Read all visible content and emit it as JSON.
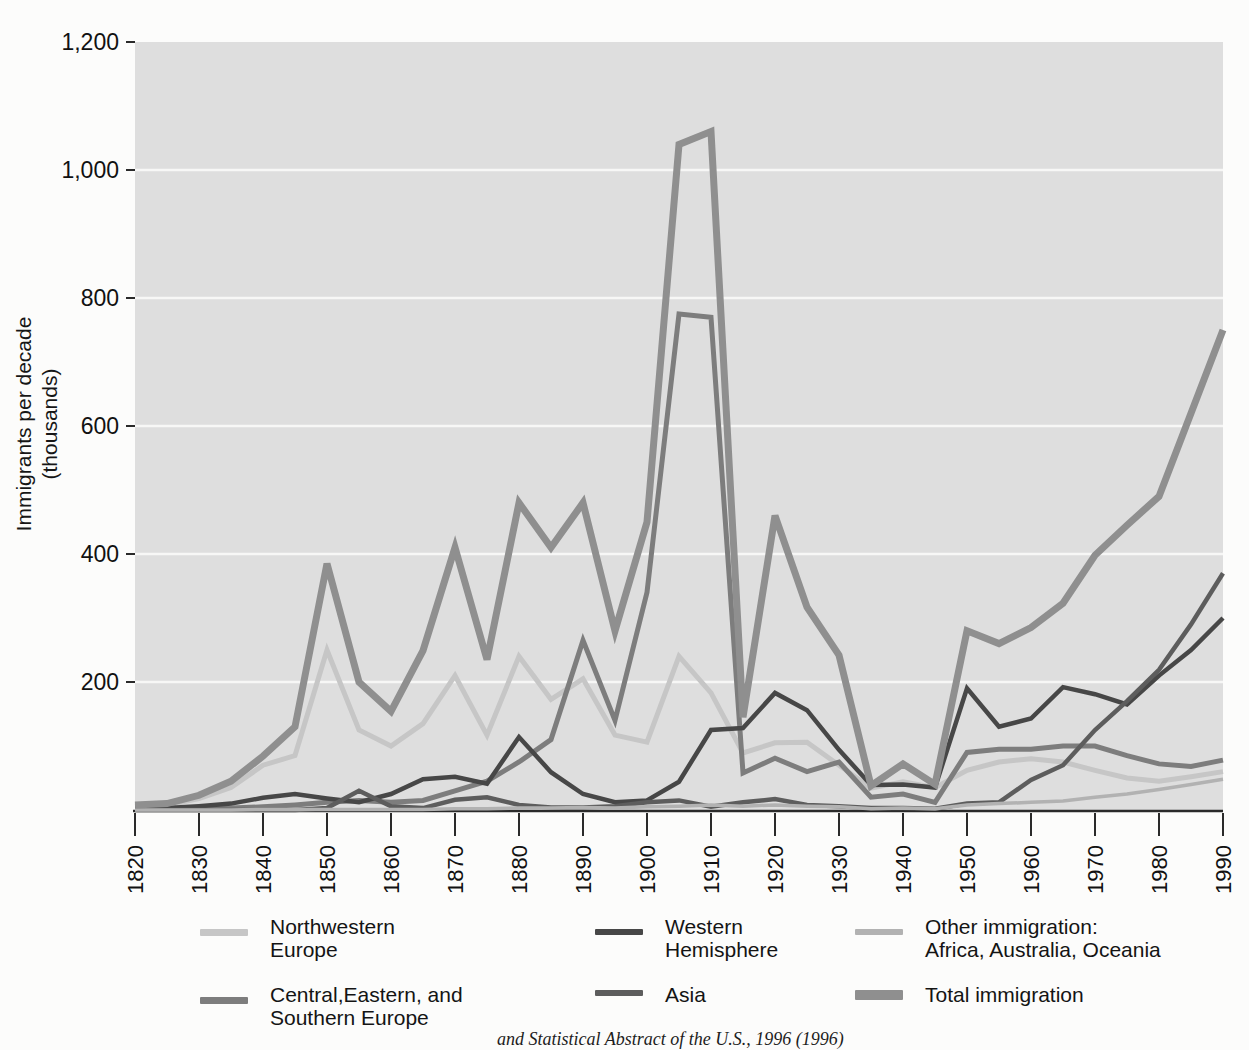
{
  "figure": {
    "y_axis_title_line1": "Immigrants per decade",
    "y_axis_title_line2": "(thousands)",
    "caption_partial": "and Statistical Abstract of the U.S., 1996 (1996)"
  },
  "colors": {
    "plot_background": "#dedede",
    "gridline": "#f7f7f6",
    "axis": "#2a2a2a",
    "tick_text": "#111111"
  },
  "chart_data": {
    "type": "line",
    "title": "",
    "xlabel": "",
    "ylabel": "Immigrants per decade (thousands)",
    "ylim": [
      0,
      1200
    ],
    "y_ticks": [
      200,
      400,
      600,
      800,
      1000,
      1200
    ],
    "x_ticks": [
      1820,
      1830,
      1840,
      1850,
      1860,
      1870,
      1880,
      1890,
      1900,
      1910,
      1920,
      1930,
      1940,
      1950,
      1960,
      1970,
      1980,
      1990
    ],
    "grid": true,
    "legend_position": "bottom",
    "x": [
      1820,
      1825,
      1830,
      1835,
      1840,
      1845,
      1850,
      1855,
      1860,
      1865,
      1870,
      1875,
      1880,
      1885,
      1890,
      1895,
      1900,
      1905,
      1910,
      1915,
      1920,
      1925,
      1930,
      1935,
      1940,
      1945,
      1950,
      1955,
      1960,
      1965,
      1970,
      1975,
      1980,
      1985,
      1990
    ],
    "series": [
      {
        "name": "Northwestern Europe",
        "color": "#c6c6c6",
        "width": 5,
        "values": [
          6,
          8,
          18,
          35,
          70,
          85,
          250,
          125,
          100,
          135,
          210,
          117,
          240,
          173,
          205,
          117,
          106,
          240,
          183,
          89,
          105,
          106,
          70,
          34,
          44,
          35,
          62,
          75,
          80,
          75,
          62,
          50,
          45,
          52,
          60
        ]
      },
      {
        "name": "Central,Eastern, and Southern Europe",
        "color": "#7d7d7d",
        "width": 5,
        "values": [
          1,
          1,
          2,
          3,
          5,
          8,
          12,
          15,
          12,
          15,
          30,
          45,
          75,
          110,
          265,
          140,
          340,
          775,
          770,
          58,
          81,
          60,
          75,
          20,
          25,
          12,
          90,
          95,
          95,
          100,
          100,
          85,
          72,
          68,
          78
        ]
      },
      {
        "name": "Western Hemisphere",
        "color": "#474747",
        "width": 4.5,
        "values": [
          4,
          3,
          6,
          10,
          19,
          25,
          18,
          12,
          25,
          48,
          52,
          41,
          114,
          59,
          25,
          12,
          15,
          44,
          125,
          128,
          183,
          156,
          94,
          39,
          40,
          35,
          190,
          130,
          143,
          192,
          181,
          165,
          210,
          250,
          300
        ]
      },
      {
        "name": "Asia",
        "color": "#5d5d5d",
        "width": 4.5,
        "values": [
          0,
          0,
          0,
          0,
          0,
          0,
          3,
          30,
          6,
          3,
          16,
          20,
          8,
          4,
          4,
          6,
          12,
          15,
          5,
          12,
          17,
          8,
          6,
          3,
          3,
          2,
          10,
          12,
          47,
          70,
          125,
          170,
          219,
          290,
          370
        ]
      },
      {
        "name": "Other immigration: Africa, Australia, Oceania",
        "color": "#b2b2b2",
        "width": 3.5,
        "values": [
          0,
          0,
          0,
          0,
          1,
          1,
          1,
          1,
          1,
          1,
          2,
          2,
          3,
          3,
          4,
          3,
          5,
          6,
          8,
          6,
          8,
          6,
          5,
          2,
          3,
          2,
          8,
          10,
          12,
          14,
          20,
          25,
          32,
          40,
          48
        ]
      },
      {
        "name": "Total immigration",
        "color": "#8f8f8f",
        "width": 7,
        "values": [
          8,
          10,
          23,
          45,
          84,
          130,
          385,
          200,
          154,
          249,
          410,
          235,
          480,
          410,
          480,
          280,
          450,
          1040,
          1060,
          145,
          460,
          317,
          242,
          38,
          72,
          40,
          280,
          260,
          285,
          323,
          398,
          445,
          490,
          620,
          750
        ]
      }
    ]
  },
  "legend": {
    "items": [
      {
        "series": "Northwestern Europe",
        "lines": [
          "Northwestern",
          "Europe"
        ]
      },
      {
        "series": "Western Hemisphere",
        "lines": [
          "Western",
          "Hemisphere"
        ]
      },
      {
        "series": "Other immigration: Africa, Australia, Oceania",
        "lines": [
          "Other immigration:",
          "Africa, Australia, Oceania"
        ]
      },
      {
        "series": "Central,Eastern, and Southern Europe",
        "lines": [
          "Central,Eastern, and",
          "Southern Europe"
        ]
      },
      {
        "series": "Asia",
        "lines": [
          "Asia"
        ]
      },
      {
        "series": "Total immigration",
        "lines": [
          "Total immigration"
        ]
      }
    ]
  }
}
